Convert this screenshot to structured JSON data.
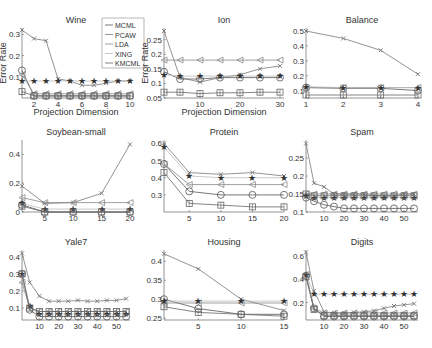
{
  "figure": {
    "ylabel": "Error Rate",
    "xlabel": "Projection Dimension",
    "legend": [
      "MCML",
      "PCAW",
      "LDA",
      "XING",
      "KMCML"
    ]
  },
  "chart_data": [
    {
      "type": "line",
      "title": "Wine",
      "panel": [
        0,
        0
      ],
      "xlabel": "Projection Dimension",
      "ylabel": "Error Rate",
      "xlim": [
        1,
        10
      ],
      "ylim": [
        0,
        0.33
      ],
      "xticks": [
        2,
        4,
        6,
        8,
        10
      ],
      "yticks": [
        0.1,
        0.2,
        0.3
      ],
      "x": [
        1,
        2,
        3,
        4,
        5,
        6,
        7,
        8,
        9,
        10
      ],
      "series": [
        {
          "name": "MCML",
          "marker": "circle",
          "values": [
            0.13,
            0.01,
            0.01,
            0.01,
            0.01,
            0.01,
            0.01,
            0.01,
            0.01,
            0.01
          ]
        },
        {
          "name": "PCAW",
          "marker": "x",
          "values": [
            0.32,
            0.28,
            0.27,
            0.09,
            0.08,
            0.06,
            0.06,
            0.07,
            0.08,
            0.08
          ]
        },
        {
          "name": "LDA",
          "marker": "triangle",
          "values": [
            0.11,
            0.02,
            0.02,
            0.02,
            0.02,
            0.02,
            0.02,
            0.02,
            0.02,
            0.02
          ]
        },
        {
          "name": "XING",
          "marker": "star",
          "values": [
            0.08,
            0.08,
            0.08,
            0.08,
            0.08,
            0.08,
            0.08,
            0.08,
            0.08,
            0.08
          ]
        },
        {
          "name": "KMCML",
          "marker": "square",
          "values": [
            0.03,
            0.01,
            0.01,
            0.01,
            0.01,
            0.01,
            0.01,
            0.01,
            0.01,
            0.01
          ]
        }
      ]
    },
    {
      "type": "line",
      "title": "Ion",
      "panel": [
        0,
        1
      ],
      "xlabel": "Projection Dimension",
      "ylabel": "Error Rate",
      "xlim": [
        1,
        31
      ],
      "ylim": [
        0.05,
        0.29
      ],
      "xticks": [
        10,
        20,
        30
      ],
      "yticks": [
        0.05,
        0.1,
        0.15,
        0.2,
        0.25
      ],
      "x": [
        1,
        5,
        10,
        15,
        20,
        25,
        30
      ],
      "series": [
        {
          "name": "MCML",
          "marker": "circle",
          "values": [
            0.14,
            0.115,
            0.115,
            0.12,
            0.12,
            0.12,
            0.12
          ]
        },
        {
          "name": "PCAW",
          "marker": "x",
          "values": [
            0.28,
            0.12,
            0.105,
            0.12,
            0.13,
            0.15,
            0.16
          ]
        },
        {
          "name": "LDA",
          "marker": "triangle",
          "values": [
            0.18,
            0.18,
            0.18,
            0.18,
            0.18,
            0.18,
            0.18
          ]
        },
        {
          "name": "XING",
          "marker": "star",
          "values": [
            0.13,
            0.125,
            0.125,
            0.125,
            0.125,
            0.125,
            0.125
          ]
        },
        {
          "name": "KMCML",
          "marker": "square",
          "values": [
            0.07,
            0.07,
            0.065,
            0.068,
            0.068,
            0.07,
            0.07
          ]
        }
      ]
    },
    {
      "type": "line",
      "title": "Balance",
      "panel": [
        0,
        2
      ],
      "xlim": [
        1,
        4
      ],
      "ylim": [
        0.05,
        0.52
      ],
      "xticks": [
        1,
        2,
        3,
        4
      ],
      "yticks": [
        0.1,
        0.2,
        0.3,
        0.4,
        0.5
      ],
      "x": [
        1,
        2,
        3,
        4
      ],
      "series": [
        {
          "name": "MCML",
          "marker": "circle",
          "values": [
            0.12,
            0.115,
            0.115,
            0.1
          ]
        },
        {
          "name": "PCAW",
          "marker": "x",
          "values": [
            0.5,
            0.45,
            0.37,
            0.21
          ]
        },
        {
          "name": "LDA",
          "marker": "triangle",
          "values": [
            0.12,
            0.12,
            0.12,
            0.12
          ]
        },
        {
          "name": "XING",
          "marker": "star",
          "values": [
            0.125,
            0.12,
            0.12,
            0.12
          ]
        },
        {
          "name": "KMCML",
          "marker": "square",
          "values": [
            0.07,
            0.07,
            0.07,
            0.07
          ]
        }
      ]
    },
    {
      "type": "line",
      "title": "Soybean-small",
      "panel": [
        1,
        0
      ],
      "xlim": [
        1,
        20
      ],
      "ylim": [
        0,
        0.5
      ],
      "xticks": [
        5,
        10,
        15,
        20
      ],
      "yticks": [
        0,
        0.2,
        0.4
      ],
      "x": [
        1,
        5,
        10,
        15,
        20
      ],
      "series": [
        {
          "name": "MCML",
          "marker": "circle",
          "values": [
            0.05,
            0.0,
            0.0,
            0.0,
            0.0
          ]
        },
        {
          "name": "PCAW",
          "marker": "x",
          "values": [
            0.18,
            0.06,
            0.065,
            0.13,
            0.47
          ]
        },
        {
          "name": "LDA",
          "marker": "triangle",
          "values": [
            0.1,
            0.065,
            0.065,
            0.065,
            0.065
          ]
        },
        {
          "name": "XING",
          "marker": "star",
          "values": [
            0.06,
            0.02,
            0.02,
            0.02,
            0.02
          ]
        },
        {
          "name": "KMCML",
          "marker": "square",
          "values": [
            0.04,
            0.0,
            0.0,
            0.0,
            0.0
          ]
        }
      ]
    },
    {
      "type": "line",
      "title": "Protein",
      "panel": [
        1,
        1
      ],
      "xlim": [
        1,
        20
      ],
      "ylim": [
        0.2,
        0.62
      ],
      "xticks": [
        5,
        10,
        15,
        20
      ],
      "yticks": [
        0.3,
        0.4,
        0.5,
        0.6
      ],
      "x": [
        1,
        5,
        10,
        15,
        20
      ],
      "series": [
        {
          "name": "MCML",
          "marker": "circle",
          "values": [
            0.48,
            0.32,
            0.3,
            0.3,
            0.3
          ]
        },
        {
          "name": "PCAW",
          "marker": "x",
          "values": [
            0.6,
            0.43,
            0.42,
            0.43,
            0.41
          ]
        },
        {
          "name": "LDA",
          "marker": "triangle",
          "values": [
            0.48,
            0.36,
            0.36,
            0.36,
            0.36
          ]
        },
        {
          "name": "XING",
          "marker": "star",
          "values": [
            0.58,
            0.41,
            0.4,
            0.4,
            0.4
          ]
        },
        {
          "name": "KMCML",
          "marker": "square",
          "values": [
            0.43,
            0.25,
            0.24,
            0.23,
            0.23
          ]
        }
      ]
    },
    {
      "type": "line",
      "title": "Spam",
      "panel": [
        1,
        2
      ],
      "xlim": [
        1,
        57
      ],
      "ylim": [
        0.1,
        0.3
      ],
      "xticks": [
        10,
        20,
        30,
        40,
        50
      ],
      "yticks": [
        0.1,
        0.15,
        0.2,
        0.25
      ],
      "x": [
        1,
        5,
        10,
        15,
        20,
        25,
        30,
        35,
        40,
        45,
        50,
        55
      ],
      "series": [
        {
          "name": "MCML",
          "marker": "circle",
          "values": [
            0.14,
            0.13,
            0.12,
            0.115,
            0.11,
            0.11,
            0.11,
            0.11,
            0.11,
            0.11,
            0.11,
            0.11
          ]
        },
        {
          "name": "PCAW",
          "marker": "x",
          "values": [
            0.29,
            0.18,
            0.17,
            0.15,
            0.15,
            0.15,
            0.15,
            0.145,
            0.145,
            0.145,
            0.15,
            0.15
          ]
        },
        {
          "name": "LDA",
          "marker": "triangle",
          "values": [
            0.15,
            0.15,
            0.15,
            0.15,
            0.15,
            0.15,
            0.15,
            0.15,
            0.15,
            0.15,
            0.15,
            0.15
          ]
        },
        {
          "name": "XING",
          "marker": "star",
          "values": [
            0.145,
            0.14,
            0.14,
            0.14,
            0.14,
            0.14,
            0.14,
            0.14,
            0.14,
            0.14,
            0.14,
            0.14
          ]
        },
        {
          "name": "KMCML",
          "marker": "square",
          "values": [
            0.15,
            0.145,
            0.145,
            0.145,
            0.145,
            0.145,
            0.145,
            0.145,
            0.145,
            0.145,
            0.145,
            0.145
          ]
        }
      ]
    },
    {
      "type": "line",
      "title": "Yale7",
      "panel": [
        2,
        0
      ],
      "xlim": [
        1,
        57
      ],
      "ylim": [
        0.03,
        0.44
      ],
      "xticks": [
        10,
        20,
        30,
        40,
        50
      ],
      "yticks": [
        0.1,
        0.2,
        0.3,
        0.4
      ],
      "x": [
        1,
        5,
        10,
        15,
        20,
        25,
        30,
        35,
        40,
        45,
        50,
        55
      ],
      "series": [
        {
          "name": "MCML",
          "marker": "circle",
          "values": [
            0.3,
            0.09,
            0.05,
            0.05,
            0.05,
            0.05,
            0.05,
            0.05,
            0.05,
            0.05,
            0.05,
            0.05
          ]
        },
        {
          "name": "PCAW",
          "marker": "x",
          "values": [
            0.42,
            0.25,
            0.17,
            0.14,
            0.14,
            0.14,
            0.145,
            0.14,
            0.14,
            0.145,
            0.145,
            0.155
          ]
        },
        {
          "name": "LDA",
          "marker": "triangle",
          "values": [
            0.25,
            0.1,
            0.08,
            0.08,
            0.08,
            0.08,
            0.08,
            0.08,
            0.08,
            0.08,
            0.08,
            0.08
          ]
        },
        {
          "name": "XING",
          "marker": "star",
          "values": [
            0.3,
            0.11,
            0.065,
            0.065,
            0.065,
            0.065,
            0.065,
            0.065,
            0.065,
            0.065,
            0.065,
            0.065
          ]
        },
        {
          "name": "KMCML",
          "marker": "square",
          "values": [
            0.3,
            0.1,
            0.08,
            0.08,
            0.08,
            0.08,
            0.08,
            0.08,
            0.08,
            0.08,
            0.08,
            0.08
          ]
        }
      ]
    },
    {
      "type": "line",
      "title": "Housing",
      "panel": [
        2,
        1
      ],
      "xlim": [
        1,
        15
      ],
      "ylim": [
        0.245,
        0.43
      ],
      "xticks": [
        5,
        10,
        15
      ],
      "yticks": [
        0.25,
        0.3,
        0.35,
        0.4
      ],
      "x": [
        1,
        5,
        10,
        15
      ],
      "series": [
        {
          "name": "MCML",
          "marker": "circle",
          "values": [
            0.3,
            0.275,
            0.26,
            0.26
          ]
        },
        {
          "name": "PCAW",
          "marker": "x",
          "values": [
            0.42,
            0.38,
            0.3,
            0.27
          ]
        },
        {
          "name": "LDA",
          "marker": "triangle",
          "values": [
            0.29,
            0.29,
            0.29,
            0.29
          ]
        },
        {
          "name": "XING",
          "marker": "star",
          "values": [
            0.295,
            0.295,
            0.295,
            0.295
          ]
        },
        {
          "name": "KMCML",
          "marker": "square",
          "values": [
            0.28,
            0.265,
            0.26,
            0.255
          ]
        }
      ]
    },
    {
      "type": "line",
      "title": "Digits",
      "panel": [
        2,
        2
      ],
      "xlim": [
        1,
        57
      ],
      "ylim": [
        0.05,
        0.65
      ],
      "xticks": [
        10,
        20,
        30,
        40,
        50
      ],
      "yticks": [
        0.2,
        0.4,
        0.6
      ],
      "x": [
        1,
        5,
        10,
        15,
        20,
        25,
        30,
        35,
        40,
        45,
        50,
        55
      ],
      "series": [
        {
          "name": "MCML",
          "marker": "circle",
          "values": [
            0.43,
            0.15,
            0.08,
            0.08,
            0.08,
            0.08,
            0.08,
            0.08,
            0.08,
            0.08,
            0.08,
            0.08
          ]
        },
        {
          "name": "PCAW",
          "marker": "x",
          "values": [
            0.63,
            0.3,
            0.12,
            0.11,
            0.11,
            0.115,
            0.12,
            0.13,
            0.15,
            0.17,
            0.18,
            0.19
          ]
        },
        {
          "name": "LDA",
          "marker": "triangle",
          "values": [
            0.44,
            0.15,
            0.11,
            0.11,
            0.11,
            0.11,
            0.11,
            0.11,
            0.11,
            0.11,
            0.11,
            0.11
          ]
        },
        {
          "name": "XING",
          "marker": "star",
          "values": [
            0.44,
            0.27,
            0.27,
            0.27,
            0.27,
            0.27,
            0.27,
            0.27,
            0.27,
            0.27,
            0.27,
            0.27
          ]
        },
        {
          "name": "KMCML",
          "marker": "square",
          "values": [
            0.42,
            0.14,
            0.09,
            0.09,
            0.09,
            0.09,
            0.09,
            0.09,
            0.09,
            0.09,
            0.09,
            0.09
          ]
        }
      ]
    }
  ]
}
